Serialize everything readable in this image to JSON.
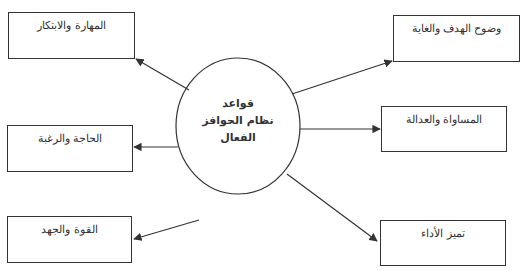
{
  "center": {
    "line1": "قواعد",
    "line2": "نظام الحوافز",
    "line3": "الفعال"
  },
  "nodes": {
    "top_left": "المهارة والابتكار",
    "middle_left": "الحاجة والرغبة",
    "bottom_left": "القوة والجهد",
    "top_right": "وضوح الهدف والغاية",
    "middle_right": "المساواة والعدالة",
    "bottom_right": "تميز الأداء"
  },
  "colors": {
    "stroke": "#333333",
    "background": "#ffffff"
  }
}
